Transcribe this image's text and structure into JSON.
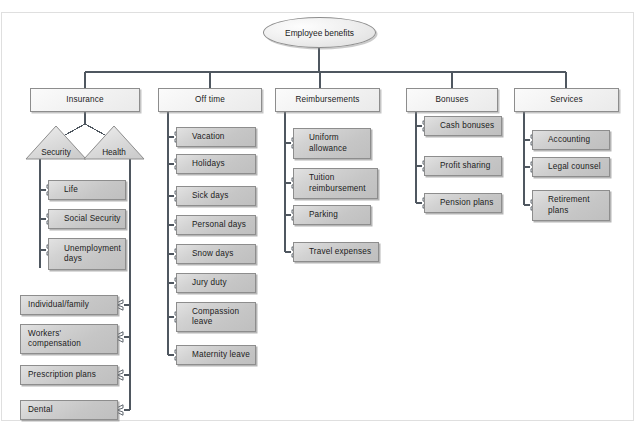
{
  "diagram": {
    "title": "Employee benefits",
    "root": {
      "label": "Employee benefits",
      "shape": "ellipse"
    },
    "branches": [
      {
        "label": "Insurance",
        "subgroups": [
          {
            "label": "Security",
            "shape": "triangle",
            "children": [
              {
                "label": "Life"
              },
              {
                "label": "Social Security"
              },
              {
                "label": "Unemployment\ndays"
              }
            ]
          },
          {
            "label": "Health",
            "shape": "triangle",
            "children": [
              {
                "label": "Individual/family"
              },
              {
                "label": "Workers'\ncompensation"
              },
              {
                "label": "Prescription plans"
              },
              {
                "label": "Dental"
              }
            ]
          }
        ]
      },
      {
        "label": "Off time",
        "children": [
          {
            "label": "Vacation"
          },
          {
            "label": "Holidays"
          },
          {
            "label": "Sick days"
          },
          {
            "label": "Personal days"
          },
          {
            "label": "Snow days"
          },
          {
            "label": "Jury duty"
          },
          {
            "label": "Compassion\nleave"
          },
          {
            "label": "Maternity leave"
          }
        ]
      },
      {
        "label": "Reimbursements",
        "children": [
          {
            "label": "Uniform\nallowance"
          },
          {
            "label": "Tuition\nreimbursement"
          },
          {
            "label": "Parking"
          },
          {
            "label": "Travel expenses"
          }
        ]
      },
      {
        "label": "Bonuses",
        "children": [
          {
            "label": "Cash bonuses"
          },
          {
            "label": "Profit sharing"
          },
          {
            "label": "Pension plans"
          }
        ]
      },
      {
        "label": "Services",
        "children": [
          {
            "label": "Accounting"
          },
          {
            "label": "Legal counsel"
          },
          {
            "label": "Retirement\nplans"
          }
        ]
      }
    ],
    "colors": {
      "child_fill": "#c8c8c8",
      "top_fill": "#f2f2f2",
      "border": "#8d8d8d",
      "connector": "#4f5760",
      "frame": "#dfdfdf",
      "text": "#1b1b1b"
    }
  }
}
